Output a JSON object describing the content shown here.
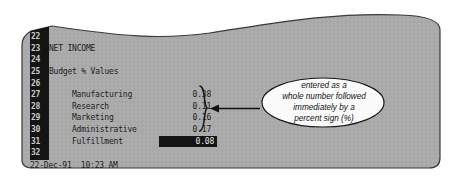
{
  "app": {
    "type": "spreadsheet-screen",
    "background_color": "#aaaaaa",
    "gutter_color": "#141414",
    "text_color": "#1d1d1d",
    "highlight_bg": "#141414",
    "highlight_fg": "#e8e8e8"
  },
  "spreadsheet": {
    "row_numbers": [
      "20",
      "21",
      "22",
      "23",
      "24",
      "25",
      "26",
      "27",
      "28",
      "29",
      "30",
      "31",
      "32"
    ],
    "rows": [
      {
        "num": "20",
        "label": "",
        "value": ""
      },
      {
        "num": "21",
        "label": "Total Expenses",
        "value": ""
      },
      {
        "num": "22",
        "label": "",
        "value": ""
      },
      {
        "num": "23",
        "label": "NET INCOME",
        "value": ""
      },
      {
        "num": "24",
        "label": "",
        "value": ""
      },
      {
        "num": "25",
        "label": "Budget % Values",
        "value": ""
      },
      {
        "num": "26",
        "label": "",
        "value": ""
      },
      {
        "num": "27",
        "label": "Manufacturing",
        "value": "0.38"
      },
      {
        "num": "28",
        "label": "Research",
        "value": "0.11"
      },
      {
        "num": "29",
        "label": "Marketing",
        "value": "0.16"
      },
      {
        "num": "30",
        "label": "Administrative",
        "value": "0.17"
      },
      {
        "num": "31",
        "label": "Fulfillment",
        "value": "0.08"
      },
      {
        "num": "32",
        "label": "",
        "value": ""
      }
    ],
    "selected_row": "31",
    "selected_cell_value": "0.08",
    "status_bar": "22-Dec-91  10:23 AM",
    "status_date": "22-Dec-91",
    "status_time": "10:23 AM"
  },
  "annotation": {
    "callout_lines": [
      "entered as a",
      "whole number followed",
      "immediately by a",
      "percent sign (%)"
    ],
    "brace_target_rows": [
      "27",
      "28",
      "29",
      "30",
      "31"
    ],
    "shape": "ellipse",
    "pointer": "left-arrow"
  }
}
